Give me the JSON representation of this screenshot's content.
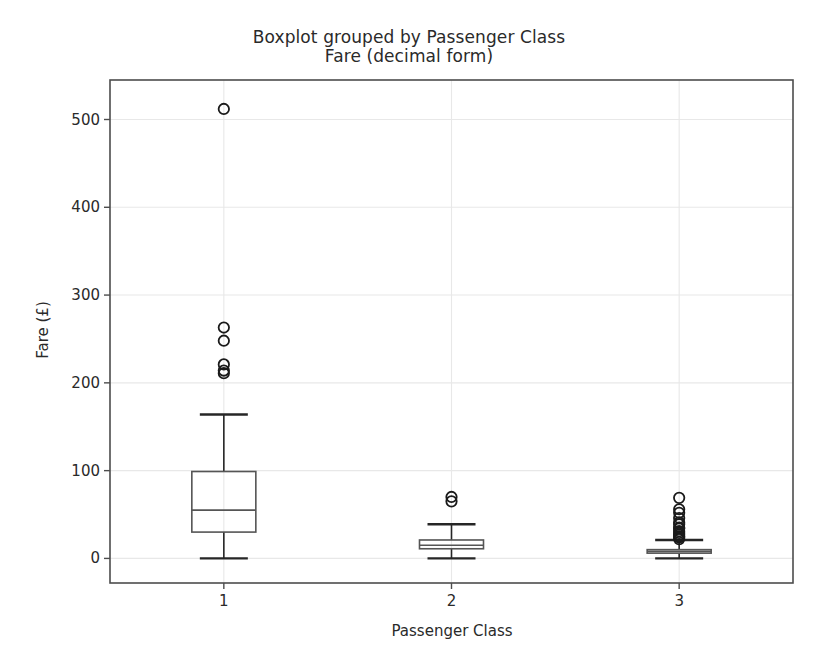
{
  "chart_data": {
    "type": "box",
    "title": "Boxplot grouped by Passenger Class",
    "subtitle": "Fare (decimal form)",
    "xlabel": "Passenger Class",
    "ylabel": "Fare (£)",
    "categories": [
      "1",
      "2",
      "3"
    ],
    "yticks": [
      0,
      100,
      200,
      300,
      400,
      500
    ],
    "ylim": [
      -28,
      545
    ],
    "grid": true,
    "legend": "none",
    "box_color": "#555555",
    "whisker_color": "#262626",
    "median_color": "#555555",
    "flier_color": "#1a1a1a",
    "grid_color": "#e8e8e8",
    "axes_color": "#4d4d4d",
    "background": "#ffffff",
    "boxes": [
      {
        "category": "1",
        "whisker_low": 0,
        "q1": 30,
        "median": 55,
        "q3": 99,
        "whisker_high": 164,
        "outliers": [
          211,
          214,
          221,
          248,
          263,
          512
        ]
      },
      {
        "category": "2",
        "whisker_low": 0,
        "q1": 11,
        "median": 15,
        "q3": 21,
        "whisker_high": 39,
        "outliers": [
          65,
          70
        ]
      },
      {
        "category": "3",
        "whisker_low": 0,
        "q1": 6,
        "median": 8,
        "q3": 10,
        "whisker_high": 21,
        "outliers": [
          22,
          24,
          25,
          27,
          29,
          31,
          34,
          35,
          39,
          41,
          46,
          52,
          56,
          69
        ]
      }
    ]
  }
}
